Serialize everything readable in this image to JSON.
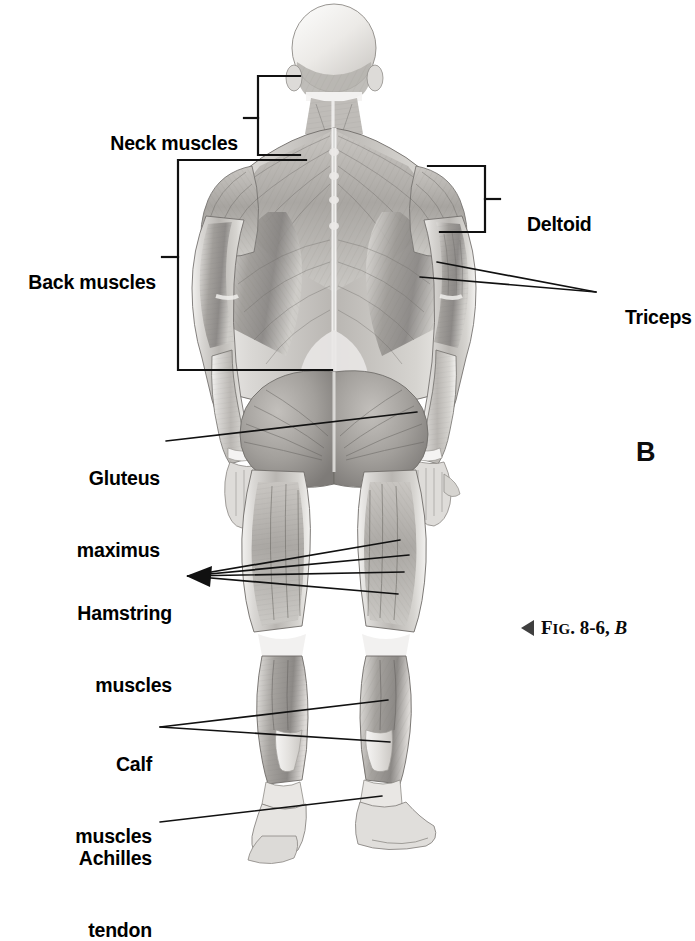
{
  "figure": {
    "panel_letter": "B",
    "caption_prefix": "F",
    "caption_smallcaps": "IG",
    "caption_mid": ". 8-6, ",
    "caption_italic": "B",
    "caption_full": "FIG. 8-6, B",
    "view": "posterior",
    "style": "grayscale airbrush medical illustration",
    "background_color": "#ffffff",
    "line_color": "#111111"
  },
  "labels": {
    "neck": {
      "text": "Neck muscles",
      "side": "left",
      "connector": "bracket"
    },
    "back": {
      "text": "Back muscles",
      "side": "left",
      "connector": "bracket"
    },
    "gluteus": {
      "line1": "Gluteus",
      "line2": "maximus",
      "side": "left",
      "connector": "leader"
    },
    "hamstring": {
      "line1": "Hamstring",
      "line2": "muscles",
      "side": "left",
      "connector": "arrow-fan"
    },
    "calf": {
      "line1": "Calf",
      "line2": "muscles",
      "side": "left",
      "connector": "leader-fan"
    },
    "achilles": {
      "line1": "Achilles",
      "line2": "tendon",
      "side": "left",
      "connector": "leader"
    },
    "deltoid": {
      "text": "Deltoid",
      "side": "right",
      "connector": "bracket"
    },
    "triceps": {
      "text": "Triceps",
      "side": "right",
      "connector": "leader-fan"
    }
  },
  "anatomy_parts": [
    "trapezius",
    "deltoid",
    "triceps brachii",
    "latissimus dorsi",
    "gluteus maximus",
    "hamstrings",
    "gastrocnemius",
    "achilles tendon"
  ]
}
